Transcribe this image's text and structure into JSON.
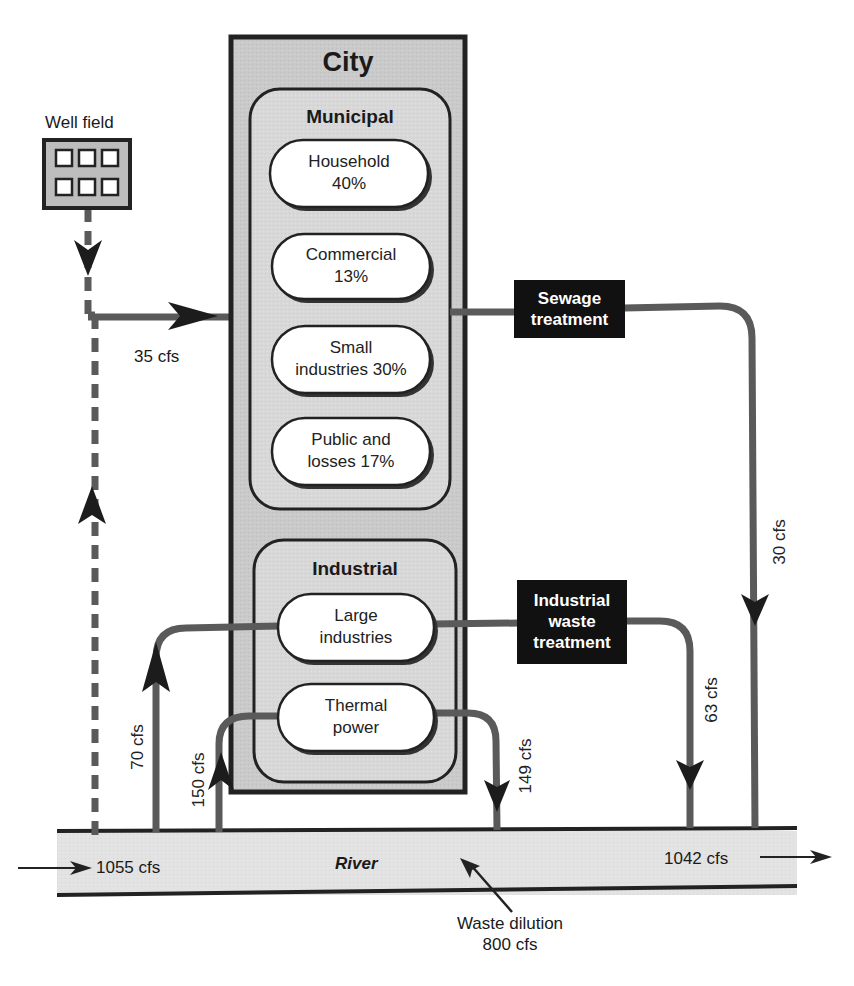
{
  "diagram": {
    "type": "water-flow",
    "colors": {
      "city_fill": "#c9c9c9",
      "panel_fill": "#d6d6d6",
      "river_fill": "#e2e2e2",
      "pipe": "#5a5a5a",
      "treatment_fill": "#111111",
      "pill_fill": "#ffffff"
    },
    "well_field": {
      "label": "Well field"
    },
    "city": {
      "title": "City",
      "municipal": {
        "title": "Municipal",
        "uses": [
          {
            "line1": "Household",
            "line2": "40%"
          },
          {
            "line1": "Commercial",
            "line2": "13%"
          },
          {
            "line1": "Small",
            "line2": "industries 30%"
          },
          {
            "line1": "Public and",
            "line2": "losses 17%"
          }
        ]
      },
      "industrial": {
        "title": "Industrial",
        "uses": [
          {
            "line1": "Large",
            "line2": "industries"
          },
          {
            "line1": "Thermal",
            "line2": "power"
          }
        ]
      }
    },
    "treatment": {
      "sewage": {
        "line1": "Sewage",
        "line2": "treatment"
      },
      "industrial": {
        "line1": "Industrial",
        "line2": "waste",
        "line3": "treatment"
      }
    },
    "flows": {
      "well_to_city": "35 cfs",
      "sewage_to_river": "30 cfs",
      "river_to_large_industries": "70 cfs",
      "river_to_thermal": "150 cfs",
      "thermal_to_river": "149 cfs",
      "industrial_waste_to_river": "63 cfs",
      "river_in": "1055 cfs",
      "river_out": "1042 cfs"
    },
    "river": {
      "label": "River"
    },
    "annotation": {
      "line1": "Waste dilution",
      "line2": "800 cfs"
    }
  }
}
